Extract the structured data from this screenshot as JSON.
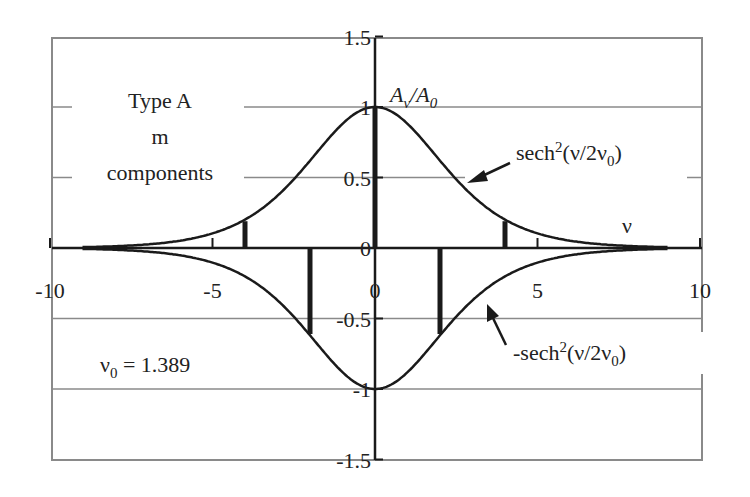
{
  "chart_data": {
    "type": "line",
    "title": "",
    "xlabel": "ν",
    "ylabel": "A_ν/A_0",
    "xlim": [
      -10,
      10
    ],
    "ylim": [
      -1.5,
      1.5
    ],
    "x_ticks": [
      "-10",
      "-5",
      "0",
      "5",
      "10"
    ],
    "y_ticks": [
      "1.5",
      "1",
      "0.5",
      "0",
      "-0.5",
      "-1",
      "-1.5"
    ],
    "grid": "horizontal",
    "nu0": 1.389,
    "series": [
      {
        "name": "sech²(ν/2ν₀)",
        "function": "sech^2(x/(2*1.389))",
        "style": "line"
      },
      {
        "name": "-sech²(ν/2ν₀)",
        "function": "-sech^2(x/(2*1.389))",
        "style": "line"
      },
      {
        "name": "m components",
        "style": "stem",
        "x": [
          -4,
          -2,
          0,
          2,
          4
        ],
        "values": [
          0.19,
          -0.61,
          1.0,
          -0.61,
          0.19
        ]
      }
    ],
    "annotations": [
      "Type A m components",
      "ν₀ = 1.389",
      "sech²(ν/2ν₀)",
      "-sech²(ν/2ν₀)",
      "A_ν/A_0",
      "ν"
    ]
  },
  "labels": {
    "type_line1": "Type A",
    "type_line2": "m",
    "type_line3": "components",
    "yaxis_A": "A",
    "yaxis_sub_nu": "ν",
    "yaxis_slash": "/A",
    "yaxis_sub_0": "0",
    "xaxis_nu": "ν",
    "nu0_nu": "ν",
    "nu0_sub": "0",
    "nu0_value": " = 1.389",
    "pos_curve_a": "sech",
    "pos_curve_sup": "2",
    "pos_curve_b": "(ν/2ν",
    "pos_curve_sub": "0",
    "pos_curve_c": ")",
    "neg_curve_a": "-sech",
    "neg_curve_sup": "2",
    "neg_curve_b": "(ν/2ν",
    "neg_curve_sub": "0",
    "neg_curve_c": ")"
  },
  "colors": {
    "curve": "#1a1a1a",
    "grid": "#8a8a8a",
    "frame": "#8a8a8a",
    "axis": "#1a1a1a"
  }
}
